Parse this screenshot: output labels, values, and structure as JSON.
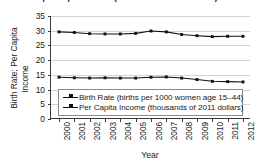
{
  "chart_data": {
    "type": "line",
    "title": "per Capita Income (thousands of 2011 dollars)",
    "xlabel": "Year",
    "ylabel_line1": "Birth Rate; Per Capita",
    "ylabel_line2": "Income",
    "ylim": [
      0,
      35
    ],
    "yticks": [
      0,
      5,
      10,
      15,
      20,
      25,
      30,
      35
    ],
    "grid": true,
    "legend_position": "lower-left-inside",
    "categories": [
      "2000",
      "2001",
      "2002",
      "2003",
      "2004",
      "2005",
      "2006",
      "2007",
      "2008",
      "2009",
      "2010",
      "2011",
      "2012"
    ],
    "series": [
      {
        "name": "Birth Rate (births per 1000 women age 15–44)",
        "marker": "square",
        "color": "#111111",
        "values": [
          14.2,
          14.0,
          13.9,
          14.0,
          13.9,
          13.9,
          14.2,
          14.3,
          13.9,
          13.4,
          12.8,
          12.7,
          12.6
        ]
      },
      {
        "name": "Per Capita Income (thousands of 2011 dollars)",
        "marker": "square",
        "color": "#111111",
        "values": [
          29.6,
          29.4,
          29.0,
          28.9,
          28.9,
          29.1,
          29.9,
          29.6,
          28.7,
          28.3,
          28.0,
          28.1,
          28.1
        ]
      }
    ]
  },
  "axis": {
    "y_tick_labels": [
      "0",
      "5",
      "10",
      "15",
      "20",
      "25",
      "30",
      "35"
    ],
    "x_tick_labels": [
      "2000",
      "2001",
      "2002",
      "2003",
      "2004",
      "2005",
      "2006",
      "2007",
      "2008",
      "2009",
      "2010",
      "2011",
      "2012"
    ]
  },
  "legend": {
    "entries": [
      {
        "label": "Birth Rate (births per 1000 women age 15–44)"
      },
      {
        "label": "Per Capita Income (thousands of 2011 dollars)"
      }
    ]
  },
  "colors": {
    "series": "#111111",
    "grid": "#d4d4d4",
    "axis": "#3a3a3a",
    "background": "#ffffff"
  }
}
